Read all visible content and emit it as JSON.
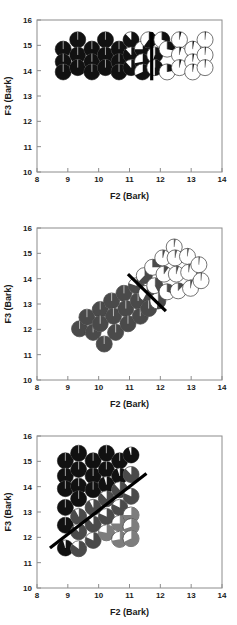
{
  "figure": {
    "axis": {
      "xlabel": "F2 (Bark)",
      "ylabel": "F3 (Bark)",
      "xticks": [
        "8",
        "9",
        "10",
        "11",
        "12",
        "13",
        "14"
      ],
      "yticks": [
        "10",
        "11",
        "12",
        "13",
        "14",
        "15",
        "16"
      ]
    },
    "colors": {
      "fill_dark": "#111111",
      "fill_mid": "#4a4a4a",
      "fill_light": "#7d7d7d",
      "open": "#ffffff",
      "outline": "#3a3a3a",
      "divider": "#000000",
      "frame": "#8c8c8c",
      "text": "#1a1a1a"
    }
  },
  "chart_data": [
    {
      "type": "scatter",
      "title": "",
      "xlabel": "F2 (Bark)",
      "ylabel": "F3 (Bark)",
      "xlim": [
        8,
        14
      ],
      "ylim": [
        10,
        16
      ],
      "xticks": [
        8,
        9,
        10,
        11,
        12,
        13,
        14
      ],
      "yticks": [
        10,
        11,
        12,
        13,
        14,
        15,
        16
      ],
      "grid": false,
      "legend": "none",
      "marker_style": "pie-fraction-circle",
      "marker_radius_bark": 0.26,
      "boundary": {
        "kind": "vertical",
        "x": 11.72,
        "y_start": 13.62,
        "y_end": 15.52
      },
      "points": [
        {
          "x": 8.85,
          "y": 14.85,
          "fill": 1.0,
          "shade": "fill_dark"
        },
        {
          "x": 8.85,
          "y": 14.35,
          "fill": 1.0,
          "shade": "fill_dark"
        },
        {
          "x": 8.85,
          "y": 13.95,
          "fill": 1.0,
          "shade": "fill_dark"
        },
        {
          "x": 9.32,
          "y": 15.22,
          "fill": 1.0,
          "shade": "fill_dark"
        },
        {
          "x": 9.32,
          "y": 14.62,
          "fill": 1.0,
          "shade": "fill_dark"
        },
        {
          "x": 9.32,
          "y": 14.12,
          "fill": 1.0,
          "shade": "fill_dark"
        },
        {
          "x": 9.78,
          "y": 14.85,
          "fill": 1.0,
          "shade": "fill_dark"
        },
        {
          "x": 9.78,
          "y": 14.35,
          "fill": 1.0,
          "shade": "fill_dark"
        },
        {
          "x": 9.78,
          "y": 13.95,
          "fill": 1.0,
          "shade": "fill_dark"
        },
        {
          "x": 10.22,
          "y": 15.22,
          "fill": 1.0,
          "shade": "fill_dark"
        },
        {
          "x": 10.22,
          "y": 14.62,
          "fill": 1.0,
          "shade": "fill_dark"
        },
        {
          "x": 10.22,
          "y": 14.12,
          "fill": 1.0,
          "shade": "fill_dark"
        },
        {
          "x": 10.66,
          "y": 14.85,
          "fill": 1.0,
          "shade": "fill_dark"
        },
        {
          "x": 10.66,
          "y": 14.35,
          "fill": 1.0,
          "shade": "fill_dark"
        },
        {
          "x": 10.66,
          "y": 13.95,
          "fill": 1.0,
          "shade": "fill_dark"
        },
        {
          "x": 11.05,
          "y": 15.22,
          "fill": 0.88,
          "shade": "fill_dark"
        },
        {
          "x": 11.05,
          "y": 14.62,
          "fill": 0.88,
          "shade": "fill_dark"
        },
        {
          "x": 11.05,
          "y": 14.12,
          "fill": 0.88,
          "shade": "fill_dark"
        },
        {
          "x": 11.42,
          "y": 14.85,
          "fill": 0.75,
          "shade": "fill_dark"
        },
        {
          "x": 11.42,
          "y": 14.35,
          "fill": 0.72,
          "shade": "fill_dark"
        },
        {
          "x": 11.42,
          "y": 13.95,
          "fill": 0.68,
          "shade": "fill_dark"
        },
        {
          "x": 11.62,
          "y": 15.22,
          "fill": 0.6,
          "shade": "fill_dark"
        },
        {
          "x": 11.82,
          "y": 14.62,
          "fill": 0.55,
          "shade": "fill_dark"
        },
        {
          "x": 11.82,
          "y": 14.12,
          "fill": 0.5,
          "shade": "fill_dark"
        },
        {
          "x": 12.05,
          "y": 15.22,
          "fill": 0.3,
          "shade": "fill_dark"
        },
        {
          "x": 12.22,
          "y": 14.85,
          "fill": 0.28,
          "shade": "fill_dark"
        },
        {
          "x": 12.22,
          "y": 13.95,
          "fill": 0.22,
          "shade": "fill_dark"
        },
        {
          "x": 12.62,
          "y": 15.22,
          "fill": 0.04,
          "shade": "fill_dark"
        },
        {
          "x": 12.62,
          "y": 14.62,
          "fill": 0.04,
          "shade": "fill_dark"
        },
        {
          "x": 12.62,
          "y": 14.12,
          "fill": 0.04,
          "shade": "fill_dark"
        },
        {
          "x": 13.05,
          "y": 14.85,
          "fill": 0.03,
          "shade": "fill_dark"
        },
        {
          "x": 13.05,
          "y": 14.35,
          "fill": 0.03,
          "shade": "fill_dark"
        },
        {
          "x": 13.05,
          "y": 13.95,
          "fill": 0.03,
          "shade": "fill_dark"
        },
        {
          "x": 13.45,
          "y": 15.22,
          "fill": 0.02,
          "shade": "fill_dark"
        },
        {
          "x": 13.45,
          "y": 14.62,
          "fill": 0.02,
          "shade": "fill_dark"
        },
        {
          "x": 13.45,
          "y": 14.12,
          "fill": 0.02,
          "shade": "fill_dark"
        }
      ]
    },
    {
      "type": "scatter",
      "title": "",
      "xlabel": "F2 (Bark)",
      "ylabel": "F3 (Bark)",
      "xlim": [
        8,
        14
      ],
      "ylim": [
        10,
        16
      ],
      "xticks": [
        8,
        9,
        10,
        11,
        12,
        13,
        14
      ],
      "yticks": [
        10,
        11,
        12,
        13,
        14,
        15,
        16
      ],
      "grid": false,
      "legend": "none",
      "marker_style": "pie-fraction-circle",
      "marker_radius_bark": 0.26,
      "boundary": {
        "kind": "diagonal",
        "x_start": 10.95,
        "y_start": 14.18,
        "x_end": 12.18,
        "y_end": 12.72
      },
      "points": [
        {
          "x": 9.38,
          "y": 12.02,
          "fill": 1.0,
          "shade": "fill_mid"
        },
        {
          "x": 9.62,
          "y": 12.48,
          "fill": 1.0,
          "shade": "fill_mid"
        },
        {
          "x": 9.82,
          "y": 11.88,
          "fill": 1.0,
          "shade": "fill_mid"
        },
        {
          "x": 10.05,
          "y": 12.78,
          "fill": 1.0,
          "shade": "fill_mid"
        },
        {
          "x": 10.05,
          "y": 12.22,
          "fill": 1.0,
          "shade": "fill_mid"
        },
        {
          "x": 10.18,
          "y": 11.42,
          "fill": 1.0,
          "shade": "fill_mid"
        },
        {
          "x": 10.42,
          "y": 13.12,
          "fill": 1.0,
          "shade": "fill_mid"
        },
        {
          "x": 10.48,
          "y": 12.52,
          "fill": 1.0,
          "shade": "fill_mid"
        },
        {
          "x": 10.55,
          "y": 11.88,
          "fill": 1.0,
          "shade": "fill_mid"
        },
        {
          "x": 10.82,
          "y": 13.42,
          "fill": 1.0,
          "shade": "fill_mid"
        },
        {
          "x": 10.88,
          "y": 12.82,
          "fill": 1.0,
          "shade": "fill_mid"
        },
        {
          "x": 10.95,
          "y": 12.22,
          "fill": 1.0,
          "shade": "fill_mid"
        },
        {
          "x": 11.22,
          "y": 13.72,
          "fill": 0.8,
          "shade": "fill_mid"
        },
        {
          "x": 11.28,
          "y": 13.12,
          "fill": 1.0,
          "shade": "fill_mid"
        },
        {
          "x": 11.35,
          "y": 12.52,
          "fill": 1.0,
          "shade": "fill_mid"
        },
        {
          "x": 11.48,
          "y": 14.12,
          "fill": 0.62,
          "shade": "fill_mid"
        },
        {
          "x": 11.55,
          "y": 13.42,
          "fill": 0.58,
          "shade": "fill_mid"
        },
        {
          "x": 11.62,
          "y": 12.82,
          "fill": 1.0,
          "shade": "fill_mid"
        },
        {
          "x": 11.75,
          "y": 14.45,
          "fill": 0.25,
          "shade": "fill_mid"
        },
        {
          "x": 11.82,
          "y": 13.72,
          "fill": 0.42,
          "shade": "fill_mid"
        },
        {
          "x": 11.92,
          "y": 13.12,
          "fill": 0.52,
          "shade": "fill_mid"
        },
        {
          "x": 12.08,
          "y": 14.82,
          "fill": 0.05,
          "shade": "fill_mid"
        },
        {
          "x": 12.12,
          "y": 14.18,
          "fill": 0.1,
          "shade": "fill_mid"
        },
        {
          "x": 12.22,
          "y": 13.48,
          "fill": 0.3,
          "shade": "fill_mid"
        },
        {
          "x": 12.45,
          "y": 15.25,
          "fill": 0.03,
          "shade": "fill_mid"
        },
        {
          "x": 12.48,
          "y": 14.82,
          "fill": 0.04,
          "shade": "fill_mid"
        },
        {
          "x": 12.52,
          "y": 14.18,
          "fill": 0.05,
          "shade": "fill_mid"
        },
        {
          "x": 12.58,
          "y": 13.52,
          "fill": 0.12,
          "shade": "fill_mid"
        },
        {
          "x": 12.88,
          "y": 14.88,
          "fill": 0.03,
          "shade": "fill_mid"
        },
        {
          "x": 12.92,
          "y": 14.25,
          "fill": 0.03,
          "shade": "fill_mid"
        },
        {
          "x": 12.98,
          "y": 13.62,
          "fill": 0.04,
          "shade": "fill_mid"
        },
        {
          "x": 13.25,
          "y": 14.55,
          "fill": 0.02,
          "shade": "fill_mid"
        },
        {
          "x": 13.32,
          "y": 13.92,
          "fill": 0.02,
          "shade": "fill_mid"
        }
      ]
    },
    {
      "type": "scatter",
      "title": "",
      "xlabel": "F2 (Bark)",
      "ylabel": "F3 (Bark)",
      "xlim": [
        8,
        14
      ],
      "ylim": [
        10,
        16
      ],
      "xticks": [
        8,
        9,
        10,
        11,
        12,
        13,
        14
      ],
      "yticks": [
        10,
        11,
        12,
        13,
        14,
        15,
        16
      ],
      "grid": false,
      "legend": "none",
      "marker_style": "pie-fraction-circle",
      "marker_radius_bark": 0.26,
      "boundary": {
        "kind": "diagonal",
        "x_start": 8.42,
        "y_start": 11.58,
        "x_end": 11.55,
        "y_end": 14.52
      },
      "points": [
        {
          "x": 8.92,
          "y": 15.02,
          "fill": 1.0,
          "shade": "fill_dark"
        },
        {
          "x": 8.92,
          "y": 14.42,
          "fill": 1.0,
          "shade": "fill_dark"
        },
        {
          "x": 8.92,
          "y": 13.92,
          "fill": 1.0,
          "shade": "fill_dark"
        },
        {
          "x": 8.92,
          "y": 13.18,
          "fill": 1.0,
          "shade": "fill_dark"
        },
        {
          "x": 8.92,
          "y": 12.48,
          "fill": 1.0,
          "shade": "fill_dark"
        },
        {
          "x": 8.92,
          "y": 11.58,
          "fill": 0.95,
          "shade": "fill_dark"
        },
        {
          "x": 9.35,
          "y": 15.32,
          "fill": 1.0,
          "shade": "fill_dark"
        },
        {
          "x": 9.35,
          "y": 14.68,
          "fill": 1.0,
          "shade": "fill_dark"
        },
        {
          "x": 9.35,
          "y": 14.02,
          "fill": 1.0,
          "shade": "fill_dark"
        },
        {
          "x": 9.35,
          "y": 13.52,
          "fill": 1.0,
          "shade": "fill_dark"
        },
        {
          "x": 9.35,
          "y": 12.82,
          "fill": 0.92,
          "shade": "fill_mid"
        },
        {
          "x": 9.35,
          "y": 12.22,
          "fill": 0.88,
          "shade": "fill_mid"
        },
        {
          "x": 9.35,
          "y": 11.55,
          "fill": 0.85,
          "shade": "fill_mid"
        },
        {
          "x": 9.82,
          "y": 15.02,
          "fill": 1.0,
          "shade": "fill_dark"
        },
        {
          "x": 9.82,
          "y": 14.42,
          "fill": 1.0,
          "shade": "fill_dark"
        },
        {
          "x": 9.82,
          "y": 13.88,
          "fill": 1.0,
          "shade": "fill_dark"
        },
        {
          "x": 9.82,
          "y": 13.18,
          "fill": 0.92,
          "shade": "fill_mid"
        },
        {
          "x": 9.82,
          "y": 12.52,
          "fill": 0.88,
          "shade": "fill_mid"
        },
        {
          "x": 9.82,
          "y": 11.88,
          "fill": 0.82,
          "shade": "fill_mid"
        },
        {
          "x": 10.25,
          "y": 15.32,
          "fill": 1.0,
          "shade": "fill_dark"
        },
        {
          "x": 10.25,
          "y": 14.68,
          "fill": 1.0,
          "shade": "fill_dark"
        },
        {
          "x": 10.25,
          "y": 14.08,
          "fill": 0.95,
          "shade": "fill_dark"
        },
        {
          "x": 10.25,
          "y": 13.52,
          "fill": 0.88,
          "shade": "fill_mid"
        },
        {
          "x": 10.25,
          "y": 12.82,
          "fill": 0.82,
          "shade": "fill_mid"
        },
        {
          "x": 10.25,
          "y": 12.18,
          "fill": 0.78,
          "shade": "fill_light"
        },
        {
          "x": 10.68,
          "y": 15.02,
          "fill": 1.0,
          "shade": "fill_dark"
        },
        {
          "x": 10.68,
          "y": 14.42,
          "fill": 0.95,
          "shade": "fill_dark"
        },
        {
          "x": 10.68,
          "y": 13.88,
          "fill": 0.88,
          "shade": "fill_mid"
        },
        {
          "x": 10.68,
          "y": 13.18,
          "fill": 0.82,
          "shade": "fill_mid"
        },
        {
          "x": 10.68,
          "y": 12.55,
          "fill": 0.75,
          "shade": "fill_light"
        },
        {
          "x": 10.68,
          "y": 11.92,
          "fill": 0.72,
          "shade": "fill_light"
        },
        {
          "x": 11.05,
          "y": 15.25,
          "fill": 0.95,
          "shade": "fill_dark"
        },
        {
          "x": 11.05,
          "y": 14.48,
          "fill": 0.88,
          "shade": "fill_mid"
        },
        {
          "x": 11.05,
          "y": 13.62,
          "fill": 0.82,
          "shade": "fill_mid"
        },
        {
          "x": 11.05,
          "y": 12.88,
          "fill": 0.75,
          "shade": "fill_light"
        },
        {
          "x": 11.05,
          "y": 12.42,
          "fill": 0.7,
          "shade": "fill_light"
        },
        {
          "x": 11.05,
          "y": 11.95,
          "fill": 0.68,
          "shade": "fill_light"
        }
      ]
    }
  ]
}
